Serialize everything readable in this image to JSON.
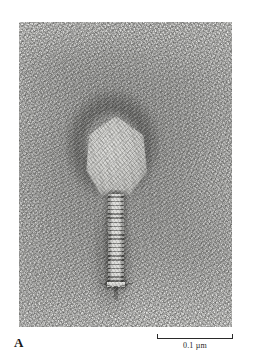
{
  "figure": {
    "type": "electron-micrograph",
    "panel_label": "A",
    "background_color": "#ffffff",
    "plate": {
      "background_color": "#e2e2e0",
      "stain_color": "#383836",
      "x": 19,
      "y": 22,
      "width": 213,
      "height": 305
    },
    "specimen": {
      "capsid_label": "head",
      "tail_label": "tail sheath",
      "baseplate_label": "baseplate",
      "capsid_color": "#cdcdca",
      "tail_color": "#d2d2cf"
    }
  },
  "scalebar": {
    "value": "0.1",
    "unit": "µm",
    "text": "0.1 µm",
    "length_px": 76,
    "color": "#2a2a2a"
  }
}
